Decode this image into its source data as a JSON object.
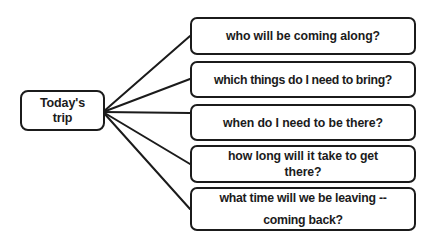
{
  "diagram": {
    "type": "mind-map",
    "background_color": "#ffffff",
    "line_color": "#1b1b1b",
    "text_color": "#1b1b1b",
    "root": {
      "label": "Today's\ntrip"
    },
    "hub": {
      "x": 103,
      "y": 112
    },
    "branches": [
      {
        "label": "who will be coming along?",
        "connector_end_x": 190,
        "connector_end_y": 36
      },
      {
        "label": "which things do I need to bring?",
        "connector_end_x": 190,
        "connector_end_y": 79
      },
      {
        "label": "when do I need to be there?",
        "connector_end_x": 190,
        "connector_end_y": 113
      },
      {
        "label": "how long will it take to get\nthere?",
        "connector_end_x": 190,
        "connector_end_y": 164
      },
      {
        "label": "what time will we be leaving --\ncoming back?",
        "connector_end_x": 190,
        "connector_end_y": 209
      }
    ]
  }
}
